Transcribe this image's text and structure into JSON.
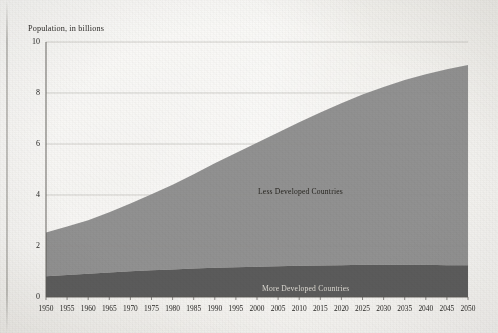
{
  "figure": {
    "y_axis_title": "Population, in billions",
    "background_color": "#efeeea"
  },
  "series_labels": {
    "less_developed": "Less Developed Countries",
    "more_developed": "More Developed Countries"
  },
  "colors": {
    "less_developed_fill": "#8d8d8d",
    "more_developed_fill": "#565656",
    "gridline": "#b9b7b1",
    "axis": "#5a5854",
    "text": "#1f1e1c"
  },
  "chart_data": {
    "type": "area",
    "title": "",
    "subtitle": "",
    "xlabel": "",
    "ylabel": "Population, in billions",
    "stacked": true,
    "grid": true,
    "legend_position": "inline-annotation",
    "xlim": [
      1950,
      2050
    ],
    "ylim": [
      0,
      10
    ],
    "yticks": [
      0,
      2,
      4,
      6,
      8,
      10
    ],
    "ytick_labels": [
      "0",
      "2",
      "4",
      "6",
      "8",
      "10"
    ],
    "x": [
      1950,
      1955,
      1960,
      1965,
      1970,
      1975,
      1980,
      1985,
      1990,
      1995,
      2000,
      2005,
      2010,
      2015,
      2020,
      2025,
      2030,
      2035,
      2040,
      2045,
      2050
    ],
    "xtick_labels": [
      "1950",
      "1955",
      "1960",
      "1965",
      "1970",
      "1975",
      "1980",
      "1985",
      "1990",
      "1995",
      "2000",
      "2005",
      "2010",
      "2015",
      "2020",
      "2025",
      "2030",
      "2035",
      "2040",
      "2045",
      "2050"
    ],
    "series": [
      {
        "name": "More Developed Countries",
        "color": "#565656",
        "values": [
          0.81,
          0.86,
          0.91,
          0.96,
          1.01,
          1.05,
          1.08,
          1.12,
          1.15,
          1.17,
          1.19,
          1.21,
          1.23,
          1.24,
          1.25,
          1.26,
          1.26,
          1.26,
          1.26,
          1.25,
          1.25
        ]
      },
      {
        "name": "Less Developed Countries",
        "color": "#8d8d8d",
        "values": [
          1.72,
          1.9,
          2.1,
          2.36,
          2.66,
          2.98,
          3.32,
          3.69,
          4.1,
          4.48,
          4.86,
          5.24,
          5.62,
          6.0,
          6.35,
          6.68,
          6.98,
          7.25,
          7.48,
          7.68,
          7.85
        ]
      }
    ],
    "totals": [
      2.53,
      2.76,
      3.01,
      3.32,
      3.67,
      4.03,
      4.4,
      4.81,
      5.25,
      5.65,
      6.05,
      6.45,
      6.85,
      7.24,
      7.6,
      7.94,
      8.24,
      8.51,
      8.74,
      8.93,
      9.1
    ]
  }
}
